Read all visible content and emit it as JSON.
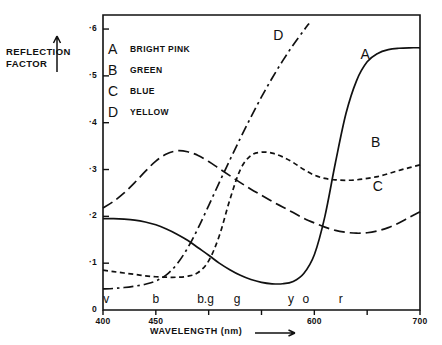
{
  "chart_data": {
    "type": "line",
    "title": "",
    "xlabel": "WAVELENGTH (nm)",
    "ylabel": "REFLECTION\nFACTOR",
    "xlim": [
      400,
      700
    ],
    "ylim": [
      0,
      0.63
    ],
    "xticks": [
      400,
      450,
      500,
      550,
      600,
      650,
      700
    ],
    "xtick_labels": [
      "400",
      "450",
      "",
      "",
      "600",
      "",
      "700"
    ],
    "yticks": [
      0,
      0.1,
      0.2,
      0.3,
      0.4,
      0.5,
      0.6
    ],
    "ytick_labels": [
      "0",
      "·1",
      "·2",
      "·3",
      "·4",
      "·5",
      "·6"
    ],
    "grid": false,
    "legend_position": "upper-left-inside",
    "axis_arrow_x": true,
    "axis_arrow_y": true,
    "spectral_band_labels": [
      {
        "letter": "v",
        "wavelength": 403
      },
      {
        "letter": "b",
        "wavelength": 450
      },
      {
        "letter": "b.g",
        "wavelength": 497
      },
      {
        "letter": "g",
        "wavelength": 527
      },
      {
        "letter": "y",
        "wavelength": 578
      },
      {
        "letter": "o",
        "wavelength": 592
      },
      {
        "letter": "r",
        "wavelength": 625
      }
    ],
    "series": [
      {
        "name": "A",
        "label": "BRIGHT PINK",
        "style": "solid",
        "annotation": "A",
        "annotation_at": [
          648,
          0.545
        ],
        "x": [
          400,
          410,
          420,
          430,
          440,
          450,
          460,
          470,
          480,
          490,
          500,
          510,
          520,
          530,
          540,
          550,
          560,
          570,
          580,
          590,
          600,
          610,
          620,
          630,
          640,
          650,
          660,
          670,
          680,
          690,
          700
        ],
        "values": [
          0.195,
          0.195,
          0.194,
          0.192,
          0.188,
          0.182,
          0.173,
          0.162,
          0.149,
          0.133,
          0.117,
          0.1,
          0.086,
          0.074,
          0.065,
          0.059,
          0.056,
          0.056,
          0.061,
          0.078,
          0.118,
          0.2,
          0.315,
          0.42,
          0.49,
          0.53,
          0.548,
          0.556,
          0.559,
          0.56,
          0.56
        ]
      },
      {
        "name": "B",
        "label": "GREEN",
        "style": "fine-dashed",
        "annotation": "B",
        "annotation_at": [
          658,
          0.357
        ],
        "x": [
          400,
          410,
          420,
          430,
          440,
          450,
          460,
          470,
          480,
          490,
          500,
          510,
          520,
          530,
          540,
          550,
          560,
          570,
          580,
          590,
          600,
          610,
          620,
          630,
          640,
          650,
          660,
          670,
          680,
          690,
          700
        ],
        "values": [
          0.085,
          0.082,
          0.079,
          0.076,
          0.073,
          0.071,
          0.07,
          0.07,
          0.072,
          0.08,
          0.105,
          0.158,
          0.235,
          0.3,
          0.33,
          0.337,
          0.335,
          0.327,
          0.315,
          0.3,
          0.288,
          0.281,
          0.278,
          0.277,
          0.278,
          0.281,
          0.285,
          0.291,
          0.298,
          0.304,
          0.31
        ]
      },
      {
        "name": "C",
        "label": "BLUE",
        "style": "long-dashed",
        "annotation": "C",
        "annotation_at": [
          660,
          0.262
        ],
        "x": [
          400,
          410,
          420,
          430,
          440,
          450,
          460,
          470,
          480,
          490,
          500,
          510,
          520,
          530,
          540,
          550,
          560,
          570,
          580,
          590,
          600,
          610,
          620,
          630,
          640,
          650,
          660,
          670,
          680,
          690,
          700
        ],
        "values": [
          0.218,
          0.232,
          0.25,
          0.272,
          0.296,
          0.318,
          0.333,
          0.34,
          0.338,
          0.33,
          0.317,
          0.302,
          0.287,
          0.272,
          0.258,
          0.245,
          0.232,
          0.22,
          0.208,
          0.196,
          0.186,
          0.177,
          0.17,
          0.166,
          0.164,
          0.165,
          0.169,
          0.176,
          0.186,
          0.198,
          0.21
        ]
      },
      {
        "name": "D",
        "label": "YELLOW",
        "style": "dash-dot",
        "annotation": "D",
        "annotation_at": [
          566,
          0.585
        ],
        "x": [
          400,
          410,
          420,
          430,
          440,
          450,
          460,
          470,
          480,
          490,
          500,
          510,
          520,
          530,
          540,
          550,
          560,
          570,
          580,
          590,
          595
        ],
        "values": [
          0.045,
          0.046,
          0.048,
          0.051,
          0.055,
          0.062,
          0.075,
          0.098,
          0.132,
          0.175,
          0.223,
          0.272,
          0.32,
          0.367,
          0.412,
          0.455,
          0.495,
          0.532,
          0.566,
          0.597,
          0.612
        ]
      }
    ]
  },
  "legend": {
    "items": [
      {
        "key": "A",
        "label": "BRIGHT PINK"
      },
      {
        "key": "B",
        "label": "GREEN"
      },
      {
        "key": "C",
        "label": "BLUE"
      },
      {
        "key": "D",
        "label": "YELLOW"
      }
    ]
  },
  "colors": {
    "ink": "#111111",
    "background": "#ffffff"
  }
}
